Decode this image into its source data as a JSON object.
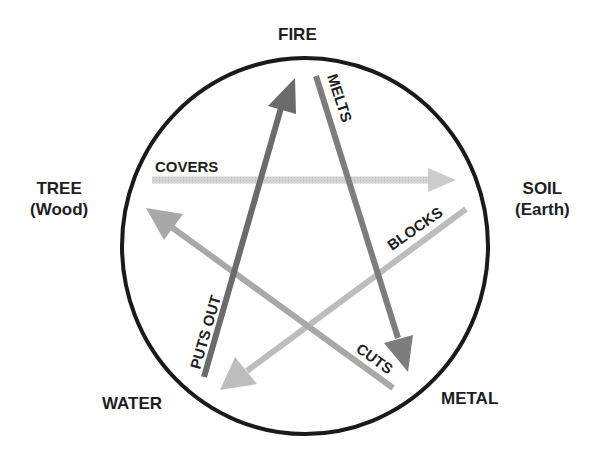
{
  "diagram": {
    "nodes": {
      "fire": {
        "label": "FIRE"
      },
      "soil": {
        "label": "SOIL",
        "sublabel": "(Earth)"
      },
      "metal": {
        "label": "METAL"
      },
      "water": {
        "label": "WATER"
      },
      "tree": {
        "label": "TREE",
        "sublabel": "(Wood)"
      }
    },
    "relations": [
      {
        "id": "puts-out",
        "from": "WATER",
        "to": "FIRE",
        "label": "PUTS OUT",
        "color": "#6b6b6b"
      },
      {
        "id": "melts",
        "from": "FIRE",
        "to": "METAL",
        "label": "MELTS",
        "color": "#7d7d7d"
      },
      {
        "id": "cuts",
        "from": "METAL",
        "to": "TREE",
        "label": "CUTS",
        "color": "#a6a6a6"
      },
      {
        "id": "covers",
        "from": "TREE",
        "to": "SOIL",
        "label": "COVERS",
        "color": "#cfcfcf"
      },
      {
        "id": "blocks",
        "from": "SOIL",
        "to": "WATER",
        "label": "BLOCKS",
        "color": "#bdbdbd"
      }
    ],
    "colors": {
      "circle": "#1a1a1a",
      "text": "#1e1e1e",
      "background": "#ffffff"
    }
  }
}
